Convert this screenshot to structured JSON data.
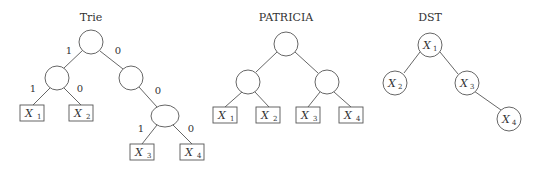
{
  "diagrams": {
    "trie": {
      "title": "Trie",
      "edge_labels": {
        "root_left": "1",
        "root_right": "0",
        "l_left": "1",
        "l_right": "0",
        "r_right": "0",
        "rr_left": "1",
        "rr_right": "0"
      },
      "leaves": [
        {
          "var": "X",
          "sub": "1"
        },
        {
          "var": "X",
          "sub": "2"
        },
        {
          "var": "X",
          "sub": "3"
        },
        {
          "var": "X",
          "sub": "4"
        }
      ]
    },
    "patricia": {
      "title": "PATRICIA",
      "leaves": [
        {
          "var": "X",
          "sub": "1"
        },
        {
          "var": "X",
          "sub": "2"
        },
        {
          "var": "X",
          "sub": "3"
        },
        {
          "var": "X",
          "sub": "4"
        }
      ]
    },
    "dst": {
      "title": "DST",
      "nodes": [
        {
          "var": "X",
          "sub": "1"
        },
        {
          "var": "X",
          "sub": "2"
        },
        {
          "var": "X",
          "sub": "3"
        },
        {
          "var": "X",
          "sub": "4"
        }
      ]
    }
  }
}
